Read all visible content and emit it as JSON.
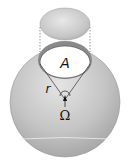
{
  "diagram": {
    "type": "solid-angle-steradian",
    "labels": {
      "area": "A",
      "radius": "r",
      "solid_angle": "Ω"
    },
    "colors": {
      "sphere_fill": "#bdbdbd",
      "sphere_highlight": "#e6e6e6",
      "cap_fill": "#ffffff",
      "stroke": "#333333"
    }
  }
}
